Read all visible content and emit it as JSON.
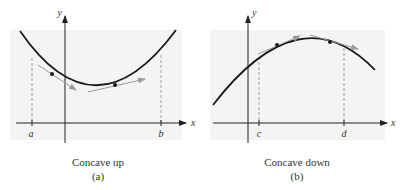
{
  "panels": [
    {
      "id": "a",
      "title": "Concave up",
      "sublabel": "(a)",
      "axes": {
        "x_label": "x",
        "y_label": "y"
      },
      "ticks": [
        "a",
        "b"
      ],
      "curve": "concave up parabola",
      "tangent_points": 2
    },
    {
      "id": "b",
      "title": "Concave down",
      "sublabel": "(b)",
      "axes": {
        "x_label": "x",
        "y_label": "y"
      },
      "ticks": [
        "c",
        "d"
      ],
      "curve": "concave down arc",
      "tangent_points": 2
    }
  ],
  "colors": {
    "panel_bg": "#f4f4f4",
    "curve": "#1a1a1a",
    "tangent": "#9a9a9a",
    "dashed": "#888888",
    "axis": "#222222"
  }
}
